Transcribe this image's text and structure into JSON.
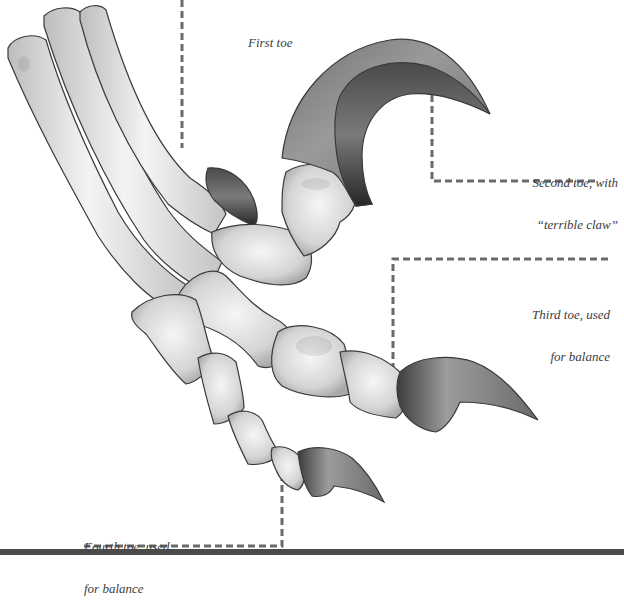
{
  "figure": {
    "colors": {
      "bone_light": "#f2f2f2",
      "bone_mid": "#d0d0d0",
      "bone_outline": "#3a3a3a",
      "claw_light": "#8a8a8a",
      "claw_dark": "#3e3e3e",
      "leader_line": "#6a6a6a",
      "label_text": "#3c3c3c",
      "bottom_rule": "#4a4a4a"
    },
    "labels": [
      {
        "id": "first-toe",
        "line1": "First toe",
        "line2": ""
      },
      {
        "id": "second-toe",
        "line1": "Second toe, with",
        "line2": "“terrible claw”"
      },
      {
        "id": "third-toe",
        "line1": "Third toe, used",
        "line2": "for balance"
      },
      {
        "id": "fourth-toe",
        "line1": "Fourth toe, used",
        "line2": "for balance"
      }
    ]
  }
}
